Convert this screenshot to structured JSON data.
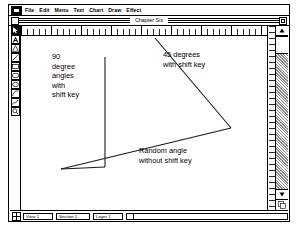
{
  "window": {
    "title": "Chapter Six",
    "close_box": "close-box",
    "zoom_box": "zoom-box"
  },
  "menubar": {
    "apple_icon": "apple-menu-icon",
    "items": [
      {
        "label": "File"
      },
      {
        "label": "Edit"
      },
      {
        "label": "Menu"
      },
      {
        "label": "Text"
      },
      {
        "label": "Chart"
      },
      {
        "label": "Draw"
      },
      {
        "label": "Effect"
      }
    ]
  },
  "palette": {
    "tools": [
      {
        "name": "arrow-select-tool",
        "icon": "arrow-icon",
        "selected": true
      },
      {
        "name": "text-tool",
        "icon": "letter-a-icon",
        "selected": false
      },
      {
        "name": "polygon-tool",
        "icon": "triangle-icon",
        "selected": false
      },
      {
        "name": "line-tool",
        "icon": "diagonal-line-icon",
        "selected": false
      },
      {
        "name": "rectangle-tool",
        "icon": "rectangle-icon",
        "selected": false
      },
      {
        "name": "rounded-rectangle-tool",
        "icon": "rounded-rectangle-icon",
        "selected": false
      },
      {
        "name": "oval-tool",
        "icon": "oval-icon",
        "selected": false
      },
      {
        "name": "arc-tool",
        "icon": "arc-icon",
        "selected": false
      },
      {
        "name": "freehand-tool",
        "icon": "freehand-icon",
        "selected": false
      },
      {
        "name": "zoom-tool",
        "icon": "magnifier-icon",
        "selected": false
      }
    ]
  },
  "canvas": {
    "annotations": {
      "left": [
        "90",
        "degree",
        "angles",
        "with",
        "shift key"
      ],
      "right_top": [
        "45 degrees",
        "with shift key"
      ],
      "bottom": [
        "Random angle",
        "without shift key"
      ]
    },
    "drawing": {
      "lines": [
        {
          "name": "vertical-line-90deg",
          "x1": 84,
          "y1": 21,
          "x2": 84,
          "y2": 131
        },
        {
          "name": "horizontal-line-90deg",
          "x1": 84,
          "y1": 131,
          "x2": 40,
          "y2": 133
        },
        {
          "name": "diagonal-line-45deg",
          "x1": 134,
          "y1": 2,
          "x2": 210,
          "y2": 92
        },
        {
          "name": "random-angle-line",
          "x1": 210,
          "y1": 92,
          "x2": 40,
          "y2": 133
        }
      ]
    }
  },
  "statusbar": {
    "page_icon": "page-navigation-icon",
    "fields": [
      {
        "name": "view-field",
        "value": "View 1"
      },
      {
        "name": "section-field",
        "value": "Section 1"
      },
      {
        "name": "layer-field",
        "value": "Layer 1"
      }
    ]
  }
}
